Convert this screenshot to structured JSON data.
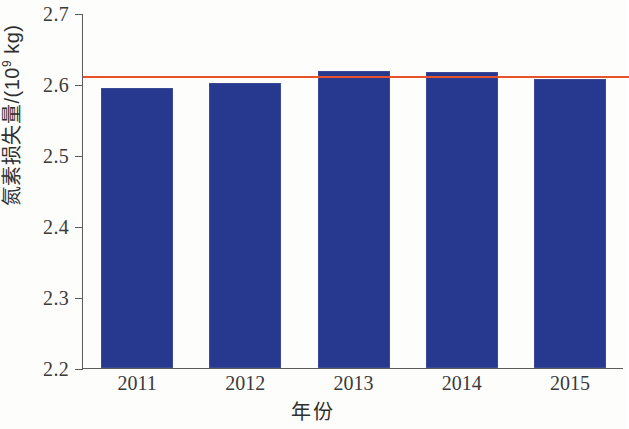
{
  "chart_data": {
    "type": "bar",
    "title": "",
    "xlabel": "年份",
    "ylabel": "氮素损失量/(10⁹ kg)",
    "ylabel_parts": {
      "text": "氮素损失量/(10",
      "exponent": "9",
      "suffix": " kg)"
    },
    "categories": [
      "2011",
      "2012",
      "2013",
      "2014",
      "2015"
    ],
    "values": [
      2.595,
      2.601,
      2.618,
      2.617,
      2.607
    ],
    "series": [
      {
        "name": "氮素损失量",
        "values": [
          2.595,
          2.601,
          2.618,
          2.617,
          2.607
        ],
        "color": "#27398f"
      }
    ],
    "ylim": [
      2.2,
      2.7
    ],
    "yticks": [
      2.2,
      2.3,
      2.4,
      2.5,
      2.6,
      2.7
    ],
    "ytick_labels": [
      "2.2",
      "2.3",
      "2.4",
      "2.5",
      "2.6",
      "2.7"
    ],
    "grid": false,
    "legend": "none",
    "annotations": [
      {
        "type": "hline",
        "name": "mean-reference-line",
        "value": 2.612,
        "color": "#e8532b"
      }
    ]
  }
}
